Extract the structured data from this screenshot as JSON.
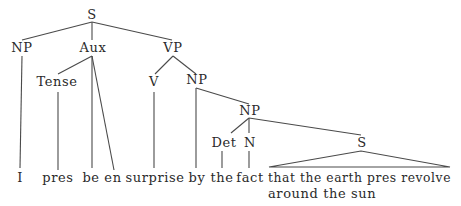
{
  "diagram": {
    "type": "syntax-tree",
    "nodes": {
      "root_s": "S",
      "subject_np": "NP",
      "aux": "Aux",
      "vp": "VP",
      "tense": "Tense",
      "verb": "V",
      "object_np": "NP",
      "inner_np": "NP",
      "det": "Det",
      "noun": "N",
      "embedded_s": "S"
    },
    "terminals": {
      "i": "I",
      "pres": "pres",
      "be": "be",
      "en": "en",
      "surprise": "surprise",
      "by": "by",
      "the": "the",
      "fact": "fact",
      "clause_line1": "that the earth pres revolve",
      "clause_line2": "around the sun"
    }
  }
}
